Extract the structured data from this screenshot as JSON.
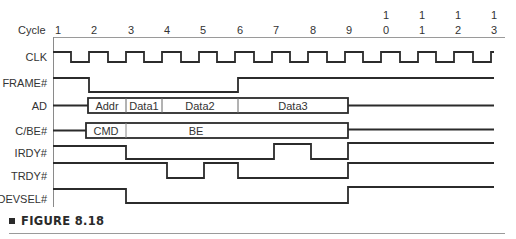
{
  "diagram": {
    "type": "timing-diagram",
    "cycle_label": "Cycle",
    "cycles": [
      {
        "top": "",
        "bottom": "1"
      },
      {
        "top": "",
        "bottom": "2"
      },
      {
        "top": "",
        "bottom": "3"
      },
      {
        "top": "",
        "bottom": "4"
      },
      {
        "top": "",
        "bottom": "5"
      },
      {
        "top": "",
        "bottom": "6"
      },
      {
        "top": "",
        "bottom": "7"
      },
      {
        "top": "",
        "bottom": "8"
      },
      {
        "top": "",
        "bottom": "9"
      },
      {
        "top": "1",
        "bottom": "0"
      },
      {
        "top": "1",
        "bottom": "1"
      },
      {
        "top": "1",
        "bottom": "2"
      },
      {
        "top": "1",
        "bottom": "3"
      }
    ],
    "signals": [
      {
        "name": "CLK"
      },
      {
        "name": "FRAME#"
      },
      {
        "name": "AD",
        "bus_segments": [
          "Addr",
          "Data1",
          "Data2",
          "Data3"
        ]
      },
      {
        "name": "C/BE#",
        "bus_segments": [
          "CMD",
          "BE"
        ]
      },
      {
        "name": "IRDY#"
      },
      {
        "name": "TRDY#"
      },
      {
        "name": "DEVSEL#"
      }
    ]
  },
  "caption": {
    "text": "FIGURE 8.18"
  }
}
